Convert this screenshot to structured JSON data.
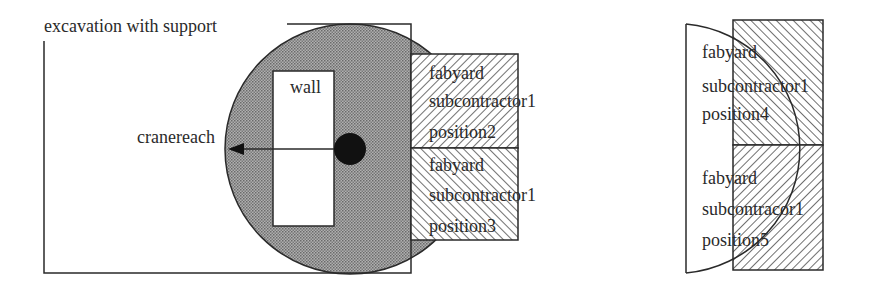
{
  "left_diagram": {
    "excavation_label": "excavation with support",
    "wall_label": "wall",
    "crane_label": "cranereach",
    "boxes": [
      {
        "id": "position2",
        "lines": [
          "fabyard",
          "subcontractor1",
          "position2"
        ],
        "hatch": "backslash"
      },
      {
        "id": "position3",
        "lines": [
          "fabyard",
          "subcontractor1",
          "position3"
        ],
        "hatch": "slash"
      }
    ]
  },
  "right_diagram": {
    "boxes": [
      {
        "id": "position4",
        "lines": [
          "fabyard",
          "subcontractor1",
          "position4"
        ],
        "hatch": "slash"
      },
      {
        "id": "position5",
        "lines": [
          "fabyard",
          "subcontracor1",
          "position5"
        ],
        "hatch": "backslash"
      }
    ]
  },
  "colors": {
    "stroke": "#2a2a2a",
    "crane_area": "#9a9a9a",
    "crane_dot": "#111111",
    "hatch": "#333333"
  }
}
